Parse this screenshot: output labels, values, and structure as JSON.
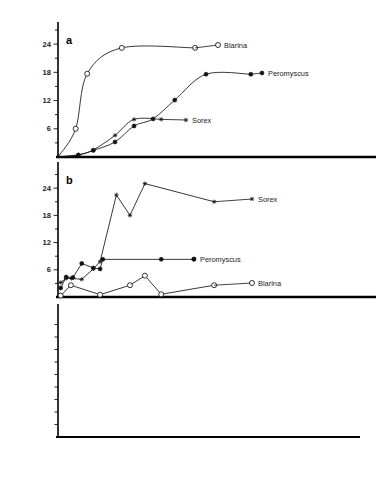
{
  "figure": {
    "name": "three-panel-predation-figure",
    "xaxis_title": "Cocoon density in thousands / acre",
    "x_ticks_labeled": [
      500,
      1000,
      1500
    ],
    "x_minor_step": 100,
    "xlim": [
      0,
      1900
    ]
  },
  "panels": {
    "a": {
      "letter": "a",
      "ylabel_line1": "Number of cocoons opened per day",
      "ylabel_line2": "per animal",
      "y_ticks_labeled": [
        6,
        12,
        18,
        24
      ],
      "ylim": [
        0,
        27
      ],
      "labels": {
        "blarina": "Blarina",
        "peromyscus": "Peromyscus",
        "sorex": "Sorex"
      }
    },
    "b": {
      "letter": "b",
      "ylabel": "Number of mice / shrews per acre",
      "y_ticks_labeled": [
        6,
        12,
        18,
        24
      ],
      "ylim": [
        0,
        28
      ],
      "labels": {
        "sorex": "Sorex",
        "peromyscus": "Peromyscus",
        "blarina": "Blarina"
      }
    },
    "c": {
      "letter": "c",
      "ylabel": "Percentage of prey eaten",
      "y_tick_count": 9,
      "ylim": [
        0,
        100
      ],
      "labels": {
        "total": "Total",
        "sorex": "Sorex",
        "peromyscus": "Peromyscus",
        "blarina": "Blarina"
      }
    }
  },
  "chart_data": [
    {
      "id": "panel-a",
      "type": "line",
      "title": "a",
      "xlabel": "Cocoon density in thousands / acre",
      "ylabel": "Number of cocoons opened per day per animal",
      "xlim": [
        0,
        1900
      ],
      "ylim": [
        0,
        27
      ],
      "yticks": [
        6,
        12,
        18,
        24
      ],
      "xticks": [
        500,
        1000,
        1500
      ],
      "grid": false,
      "legend_position": "inline-right-of-curve",
      "series": [
        {
          "name": "Blarina",
          "marker": "open-circle",
          "x": [
            0,
            130,
            215,
            470,
            1010
          ],
          "y": [
            0,
            6.0,
            17.7,
            23.2,
            23.2
          ]
        },
        {
          "name": "Peromyscus",
          "marker": "filled-circle",
          "x": [
            0,
            150,
            260,
            420,
            560,
            700,
            860,
            1090,
            1420
          ],
          "y": [
            0,
            0.4,
            1.4,
            3.2,
            6.6,
            8.1,
            12.1,
            17.6,
            17.6
          ]
        },
        {
          "name": "Sorex",
          "marker": "small-star",
          "x": [
            0,
            150,
            260,
            420,
            560,
            760
          ],
          "y": [
            0,
            0.5,
            1.5,
            4.6,
            8.0,
            8.0
          ]
        }
      ]
    },
    {
      "id": "panel-b",
      "type": "line",
      "title": "b",
      "xlabel": "Cocoon density in thousands / acre",
      "ylabel": "Number of mice / shrews per acre",
      "xlim": [
        0,
        1900
      ],
      "ylim": [
        0,
        28
      ],
      "yticks": [
        6,
        12,
        18,
        24
      ],
      "xticks": [
        500,
        1000,
        1500
      ],
      "grid": false,
      "legend_position": "inline-right-of-curve",
      "series": [
        {
          "name": "Sorex",
          "marker": "small-star",
          "x": [
            20,
            60,
            100,
            175,
            260,
            310,
            430,
            530,
            640,
            1150
          ],
          "y": [
            3.2,
            4.1,
            4.1,
            3.9,
            6.2,
            7.8,
            22.5,
            18.0,
            25.0,
            21.0
          ]
        },
        {
          "name": "Peromyscus",
          "marker": "filled-circle",
          "x": [
            20,
            60,
            110,
            175,
            260,
            310,
            330,
            760,
            1000
          ],
          "y": [
            2.0,
            4.4,
            4.3,
            7.4,
            6.4,
            6.2,
            8.3,
            8.3,
            8.3
          ]
        },
        {
          "name": "Blarina",
          "marker": "open-circle",
          "x": [
            20,
            95,
            310,
            530,
            640,
            760,
            1150
          ],
          "y": [
            0.3,
            2.6,
            0.5,
            2.6,
            4.7,
            0.6,
            2.6
          ]
        }
      ]
    },
    {
      "id": "panel-c",
      "type": "line",
      "title": "c",
      "xlabel": "Cocoon density in thousands / acre",
      "ylabel": "Percentage of prey eaten",
      "xlim": [
        0,
        1900
      ],
      "ylim": [
        0,
        100
      ],
      "grid": false,
      "legend_position": "right-edge",
      "series": [
        {
          "name": "Total",
          "marker": "none",
          "x": [
            10,
            80,
            150,
            260,
            400,
            520,
            620,
            700,
            800,
            950,
            1150,
            1400,
            1700,
            1880
          ],
          "y": [
            2,
            40,
            58,
            66,
            68,
            80,
            92,
            93,
            86,
            70,
            54,
            42,
            34,
            31
          ]
        },
        {
          "name": "Sorex",
          "marker": "filled-dot",
          "x": [
            10,
            150,
            260,
            360,
            490,
            600,
            680,
            760,
            1060,
            1400,
            1620,
            1880
          ],
          "y": [
            1,
            12,
            20,
            31,
            44,
            49,
            48,
            45,
            39,
            30,
            27,
            24
          ]
        },
        {
          "name": "Peromyscus",
          "marker": "filled-square",
          "x": [
            10,
            130,
            280,
            430,
            560,
            690,
            900,
            1130,
            1400,
            1620,
            1880
          ],
          "y": [
            1,
            8,
            14,
            22,
            29,
            34,
            31,
            27,
            23,
            21,
            20
          ]
        },
        {
          "name": "Blarina",
          "marker": "open-circle",
          "x": [
            10,
            60,
            100,
            130,
            165,
            210,
            260,
            330,
            470,
            680,
            900,
            1130,
            1400,
            1620,
            1880
          ],
          "y": [
            2,
            38,
            47,
            46,
            37,
            29,
            27,
            24,
            20,
            16,
            13,
            12,
            11,
            11,
            11
          ]
        }
      ]
    }
  ]
}
